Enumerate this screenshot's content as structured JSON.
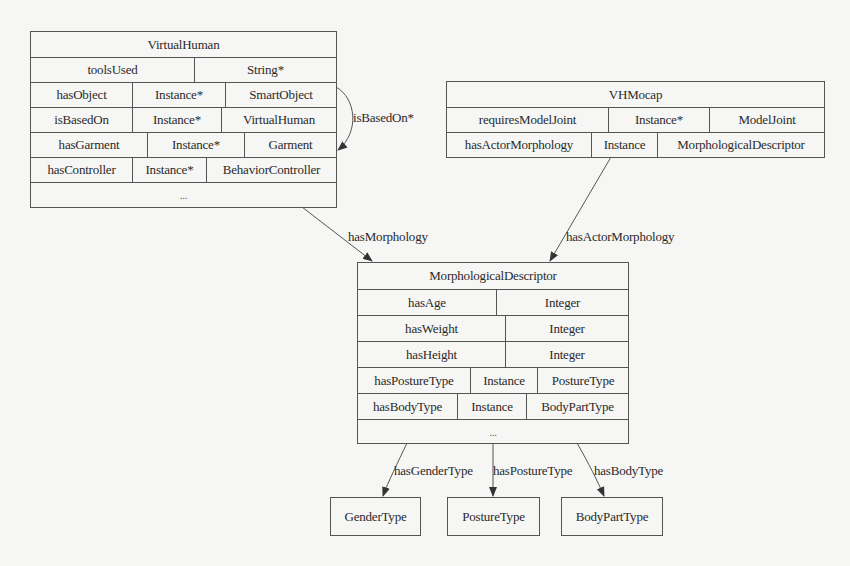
{
  "virtual_human": {
    "title": "VirtualHuman",
    "rows": [
      [
        "toolsUsed",
        "String*"
      ],
      [
        "hasObject",
        "Instance*",
        "SmartObject"
      ],
      [
        "isBasedOn",
        "Instance*",
        "VirtualHuman"
      ],
      [
        "hasGarment",
        "Instance*",
        "Garment"
      ],
      [
        "hasController",
        "Instance*",
        "BehaviorController"
      ]
    ],
    "ellipsis": "..."
  },
  "vh_mocap": {
    "title": "VHMocap",
    "rows": [
      [
        "requiresModelJoint",
        "Instance*",
        "ModelJoint"
      ],
      [
        "hasActorMorphology",
        "Instance",
        "MorphologicalDescriptor"
      ]
    ]
  },
  "morphological_descriptor": {
    "title": "MorphologicalDescriptor",
    "rows": [
      [
        "hasAge",
        "Integer"
      ],
      [
        "hasWeight",
        "Integer"
      ],
      [
        "hasHeight",
        "Integer"
      ],
      [
        "hasPostureType",
        "Instance",
        "PostureType"
      ],
      [
        "hasBodyType",
        "Instance",
        "BodyPartType"
      ]
    ],
    "ellipsis": "..."
  },
  "leaf_nodes": {
    "gender_type": "GenderType",
    "posture_type": "PostureType",
    "body_part_type": "BodyPartType"
  },
  "edges": {
    "is_based_on": "isBasedOn*",
    "has_morphology": "hasMorphology",
    "has_actor_morphology": "hasActorMorphology",
    "has_gender_type": "hasGenderType",
    "has_posture_type": "hasPostureType",
    "has_body_type": "hasBodyType"
  },
  "colors": {
    "background": "#f6f6f4",
    "line": "#555555",
    "text": "#2a2a2a"
  }
}
